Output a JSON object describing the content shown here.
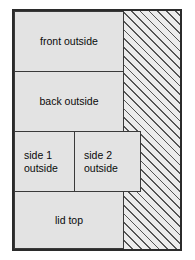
{
  "diagram": {
    "sheet": {
      "border_color": "#2b2b2b",
      "fill_color": "#e3e3e3"
    },
    "waste_region": {
      "name": "hatched waste area",
      "hatch_color": "#555555",
      "fill_color": "#ececec"
    },
    "parts": [
      {
        "id": "front-outside",
        "label": "front outside",
        "align": "center"
      },
      {
        "id": "back-outside",
        "label": "back outside",
        "align": "center"
      },
      {
        "id": "side-1-outside",
        "label": "side 1\noutside",
        "align": "left"
      },
      {
        "id": "side-2-outside",
        "label": "side 2\noutside",
        "align": "left"
      },
      {
        "id": "lid-top",
        "label": "lid top",
        "align": "center"
      }
    ]
  }
}
